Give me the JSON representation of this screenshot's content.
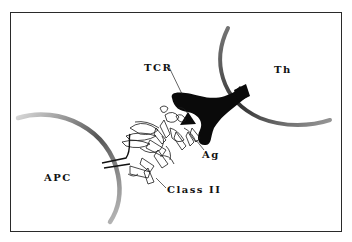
{
  "figure": {
    "labels": {
      "tcr": "TCR",
      "th": "Th",
      "ag": "Ag",
      "apc": "APC",
      "class2": "Class II"
    }
  }
}
